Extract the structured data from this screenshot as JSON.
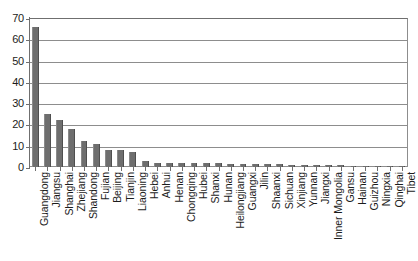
{
  "chart_data": {
    "type": "bar",
    "title": "",
    "subtitle": "",
    "xlabel": "",
    "ylabel": "",
    "ylim": [
      0,
      70
    ],
    "yticks": [
      0,
      10,
      20,
      30,
      40,
      50,
      60,
      70
    ],
    "ytick_labels": [
      "0",
      "10",
      "20",
      "30",
      "40",
      "50",
      "60",
      "70"
    ],
    "grid": true,
    "legend": false,
    "legend_position": "none",
    "bar_color": "#6e6e6e",
    "axis_color": "#6f6f6f",
    "grid_color": "#8d8d8d",
    "categories": [
      "Guangdong",
      "Jiangsu",
      "Shanghai",
      "Zhejiang",
      "Shandong",
      "Fujian",
      "Beijing",
      "Tianjin",
      "Liaoning",
      "Hebei",
      "Anhui",
      "Henan",
      "Chongqing",
      "Hubei",
      "Shanxi",
      "Hunan",
      "Heilongjiang",
      "Guangxi",
      "Jilin",
      "Shaanxi",
      "Sichuan",
      "Xinjiang",
      "Yunnan",
      "Jiangxi",
      "Inner Mongolia",
      "Gansu",
      "Hainan",
      "Guizhou",
      "Ningxia",
      "Qinghai",
      "Tibet"
    ],
    "values": [
      66,
      25,
      22,
      18,
      12,
      11,
      8,
      8,
      7,
      3,
      2,
      2,
      2,
      2,
      2,
      2,
      1.5,
      1.5,
      1.5,
      1.2,
      1.2,
      1,
      1,
      1,
      0.8,
      0.8,
      0.7,
      0.6,
      0.5,
      0.4,
      0.3
    ]
  }
}
